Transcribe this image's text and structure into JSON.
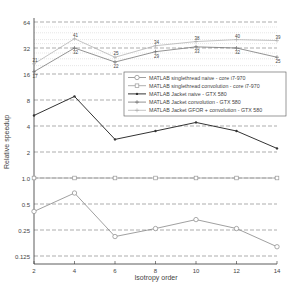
{
  "chart_data": {
    "type": "line",
    "title": "",
    "xlabel": "Isotropy order",
    "ylabel": "Relative speedup",
    "yscale": "log2",
    "ylim": [
      0.1,
      100
    ],
    "xlim": [
      2,
      14
    ],
    "x": [
      2,
      4,
      6,
      8,
      10,
      12,
      14
    ],
    "x_ticks": [
      "2",
      "4",
      "6",
      "8",
      "10",
      "12",
      "14"
    ],
    "y_ticks": [
      "0.125",
      "0.25",
      "0.5",
      "1.0",
      "2",
      "4",
      "8",
      "16",
      "32",
      "64"
    ],
    "grid": true,
    "legend_position": "upper right (inside)",
    "series": [
      {
        "name": "MATLAB singlethread naive - core i7-970",
        "marker": "circle",
        "values": [
          0.41,
          0.67,
          0.21,
          0.26,
          0.33,
          0.26,
          0.16
        ]
      },
      {
        "name": "MATLAB singlethread convolution - core i7-970",
        "marker": "square",
        "values": [
          1,
          1,
          1,
          1,
          1,
          1,
          1
        ]
      },
      {
        "name": "MATLAB Jacket naive - GTX 580",
        "marker": "dot",
        "values": [
          5.3,
          8.8,
          2.8,
          3.5,
          4.4,
          3.5,
          2.2
        ]
      },
      {
        "name": "MATLAB Jacket convolution - GTX 580",
        "marker": "plus",
        "values": [
          17,
          32,
          22,
          29,
          33,
          32,
          25
        ]
      },
      {
        "name": "MATLAB Jacket GFOR + convolution - GTX 580",
        "marker": "plus",
        "values": [
          21,
          41,
          25,
          34,
          38,
          40,
          39
        ]
      }
    ],
    "annotations": {
      "jacket_convolution": [
        "17",
        "32",
        "22",
        "29",
        "33",
        "32",
        "25"
      ],
      "jacket_gfor_convolution": [
        "21",
        "41",
        "25",
        "34",
        "38",
        "40",
        "39"
      ]
    }
  }
}
